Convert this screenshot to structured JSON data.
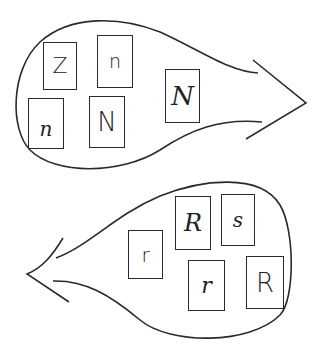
{
  "diagram": {
    "type": "letter-card sorting groups",
    "stroke_color": "#2a2a2a",
    "groups": [
      {
        "name": "upper-group",
        "arrow_direction": "right",
        "cards": [
          {
            "letter": "Z",
            "style": "print"
          },
          {
            "letter": "n",
            "style": "print"
          },
          {
            "letter": "n",
            "style": "script"
          },
          {
            "letter": "N",
            "style": "print"
          },
          {
            "letter": "N",
            "style": "script"
          }
        ]
      },
      {
        "name": "lower-group",
        "arrow_direction": "left",
        "cards": [
          {
            "letter": "r",
            "style": "print"
          },
          {
            "letter": "R",
            "style": "script"
          },
          {
            "letter": "s",
            "style": "script"
          },
          {
            "letter": "r",
            "style": "script"
          },
          {
            "letter": "R",
            "style": "print"
          }
        ]
      }
    ]
  }
}
